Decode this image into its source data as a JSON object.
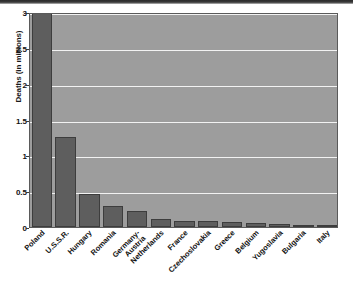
{
  "chart_data": {
    "type": "bar",
    "title": "",
    "xlabel": "",
    "ylabel": "Deaths (in millions)",
    "ylim": [
      0,
      3
    ],
    "yticks": [
      0,
      0.5,
      1,
      1.5,
      2,
      2.5,
      3
    ],
    "ytick_labels": [
      "0",
      "0.5",
      "1",
      "1.5",
      "2",
      "2.5",
      "3"
    ],
    "grid": true,
    "legend": "none",
    "categories": [
      "Poland",
      "U.S.S.R.",
      "Hungary",
      "Romania",
      "Germany-\nAustria",
      "Netherlands",
      "France",
      "Czechoslovakia",
      "Greece",
      "Belgium",
      "Yugoslavia",
      "Bulgaria",
      "Italy"
    ],
    "values": [
      3.0,
      1.25,
      0.46,
      0.3,
      0.22,
      0.105,
      0.09,
      0.08,
      0.065,
      0.055,
      0.04,
      0.025,
      0.02
    ],
    "colors": {
      "bar_fill": "#5e5e5e",
      "bar_edge": "#3d3d3d",
      "plot_background": "#9d9d9d",
      "gridline": "#f2f2f2",
      "axis": "#5a5a5a",
      "text": "#111111",
      "figure_background": "#ffffff"
    }
  }
}
